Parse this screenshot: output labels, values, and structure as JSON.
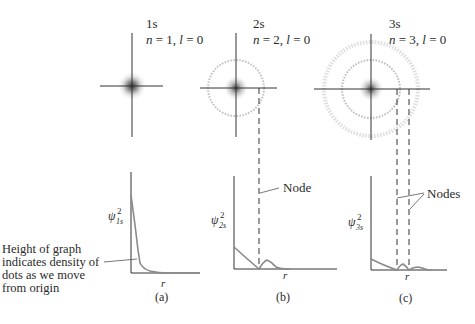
{
  "figure": {
    "panels": [
      {
        "id": "a",
        "orbital": "1s",
        "quantum_numbers": "n = 1, l = 0",
        "n": "1",
        "l": "0",
        "caption": "(a)",
        "y_label": "ψ",
        "y_label_sup": "2",
        "y_label_sub": "1s",
        "x_label": "r",
        "nodes": 0
      },
      {
        "id": "b",
        "orbital": "2s",
        "quantum_numbers": "n = 2, l = 0",
        "n": "2",
        "l": "0",
        "caption": "(b)",
        "y_label": "ψ",
        "y_label_sup": "2",
        "y_label_sub": "2s",
        "x_label": "r",
        "nodes": 1,
        "node_label": "Node"
      },
      {
        "id": "c",
        "orbital": "3s",
        "quantum_numbers": "n = 3, l = 0",
        "n": "3",
        "l": "0",
        "caption": "(c)",
        "y_label": "ψ",
        "y_label_sup": "2",
        "y_label_sub": "3s",
        "x_label": "r",
        "nodes": 2,
        "node_label": "Nodes"
      }
    ],
    "annotation": {
      "lines": [
        "Height of graph",
        "indicates density of",
        "dots as we move",
        "from origin"
      ]
    },
    "text": {
      "n_eq": "n = ",
      "l_eq": ", l = ",
      "n_sym": "n",
      "l_sym": "l",
      "eq": " = ",
      "comma": ", "
    },
    "colors": {
      "axis": "#333333",
      "curve": "#8a8a8a",
      "dots": "#555555",
      "ring": "#b5b5b5"
    }
  }
}
